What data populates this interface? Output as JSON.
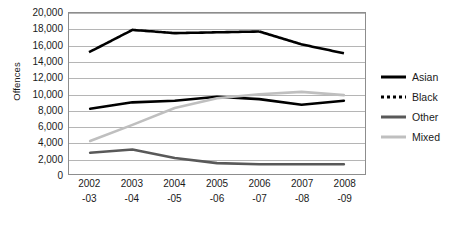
{
  "chart_data": {
    "type": "line",
    "title": "",
    "xlabel": "",
    "ylabel": "Offences",
    "ylim": [
      0,
      20000
    ],
    "ytick_step": 2000,
    "yticks": [
      "0",
      "2,000",
      "4,000",
      "6,000",
      "8,000",
      "10,000",
      "12,000",
      "14,000",
      "16,000",
      "18,000",
      "20,000"
    ],
    "grid": true,
    "legend_position": "right",
    "categories": [
      "2002\n-03",
      "2003\n-04",
      "2004\n-05",
      "2005\n-06",
      "2006\n-07",
      "2007\n-08",
      "2008\n-09"
    ],
    "category_lines": [
      [
        "2002",
        "-03"
      ],
      [
        "2003",
        "-04"
      ],
      [
        "2004",
        "-05"
      ],
      [
        "2005",
        "-06"
      ],
      [
        "2006",
        "-07"
      ],
      [
        "2007",
        "-08"
      ],
      [
        "2008",
        "-09"
      ]
    ],
    "series": [
      {
        "name": "Asian",
        "style": "solid",
        "width": 2.6,
        "color": "#000000",
        "values": [
          8100,
          8900,
          9100,
          9600,
          9300,
          8600,
          9100
        ]
      },
      {
        "name": "Black",
        "style": "dotted",
        "width": 2.6,
        "color": "#000000",
        "values": [
          15200,
          17900,
          17500,
          17600,
          17700,
          16100,
          15000
        ]
      },
      {
        "name": "Other",
        "style": "solid",
        "width": 2.6,
        "color": "#595959",
        "values": [
          2650,
          3050,
          2000,
          1350,
          1200,
          1200,
          1200
        ]
      },
      {
        "name": "Mixed",
        "style": "solid",
        "width": 2.6,
        "color": "#bfbfbf",
        "values": [
          4100,
          6100,
          8200,
          9400,
          9900,
          10200,
          9800
        ]
      }
    ]
  },
  "legend": {
    "items": [
      {
        "label": "Asian",
        "key": "asian"
      },
      {
        "label": "Black",
        "key": "black"
      },
      {
        "label": "Other",
        "key": "other"
      },
      {
        "label": "Mixed",
        "key": "mixed"
      }
    ]
  }
}
